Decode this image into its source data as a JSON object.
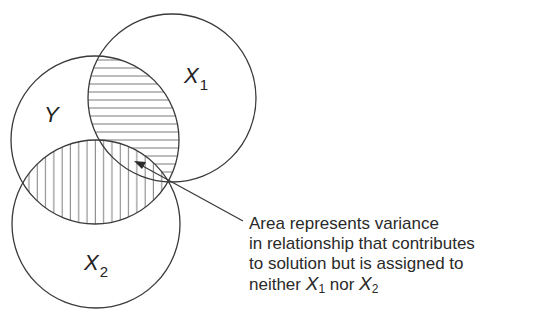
{
  "diagram": {
    "type": "venn",
    "circles": [
      {
        "id": "Y",
        "label": "Y",
        "subscript": "",
        "cx": 95,
        "cy": 140,
        "r": 84
      },
      {
        "id": "X1",
        "label": "X",
        "subscript": "1",
        "cx": 172,
        "cy": 98,
        "r": 84
      },
      {
        "id": "X2",
        "label": "X",
        "subscript": "2",
        "cx": 96,
        "cy": 224,
        "r": 84
      }
    ],
    "shaded_regions": [
      {
        "region": "Y ∩ X1",
        "pattern": "horizontal-hatch"
      },
      {
        "region": "Y ∩ X2",
        "pattern": "vertical-hatch"
      }
    ],
    "stroke_color": "#3a3a3a",
    "background_color": "#ffffff"
  },
  "labels": {
    "y": "Y",
    "x1": {
      "letter": "X",
      "sub": "1"
    },
    "x2": {
      "letter": "X",
      "sub": "2"
    }
  },
  "annotation": {
    "line1": "Area represents variance",
    "line2": "in relationship that contributes",
    "line3": "to solution but is assigned to",
    "line4_prefix": "neither ",
    "line4_var1": "X",
    "line4_sub1": "1",
    "line4_mid": " nor ",
    "line4_var2": "X",
    "line4_sub2": "2"
  }
}
